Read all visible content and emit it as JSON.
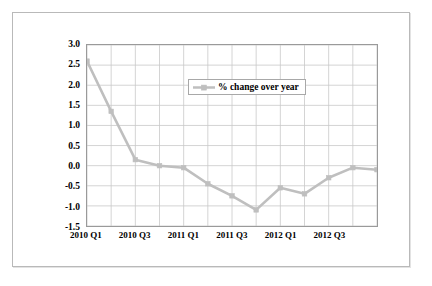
{
  "chart_data": {
    "type": "line",
    "title": "",
    "xlabel": "",
    "ylabel": "GDP at constant prices per hour worked % change over previous 12 months.",
    "ylabel_lines": [
      "GDP at constant prices per hour worked",
      "% change over previous 12 months."
    ],
    "categories": [
      "2010 Q1",
      "2010 Q2",
      "2010 Q3",
      "2010 Q4",
      "2011 Q1",
      "2011 Q2",
      "2011 Q3",
      "2011 Q4",
      "2012 Q1",
      "2012 Q2",
      "2012 Q3",
      "2012 Q4",
      "2013 Q1"
    ],
    "x_tick_labels": [
      "2010 Q1",
      "2010 Q3",
      "2011 Q1",
      "2011 Q3",
      "2012 Q1",
      "2012 Q3"
    ],
    "x_tick_indices": [
      0,
      2,
      4,
      6,
      8,
      10
    ],
    "series": [
      {
        "name": "% change over year",
        "color": "#bfbfbf",
        "marker": "square",
        "values": [
          2.6,
          1.35,
          0.15,
          0.0,
          -0.05,
          -0.45,
          -0.75,
          -1.1,
          -0.55,
          -0.7,
          -0.3,
          -0.05,
          -0.1
        ]
      }
    ],
    "ylim": [
      -1.5,
      3.0
    ],
    "y_ticks": [
      3.0,
      2.5,
      2.0,
      1.5,
      1.0,
      0.5,
      0.0,
      -0.5,
      -1.0,
      -1.5
    ],
    "y_tick_labels": [
      "3.0",
      "2.5",
      "2.0",
      "1.5",
      "1.0",
      "0.5",
      "0.0",
      "-0.5",
      "-1.0",
      "-1.5"
    ],
    "grid": true,
    "grid_color": "#c9c9c9",
    "legend_position": "upper-center",
    "plot_border_color": "#9a9a9a",
    "background": "#ffffff"
  },
  "legend": {
    "label": "% change over year"
  }
}
